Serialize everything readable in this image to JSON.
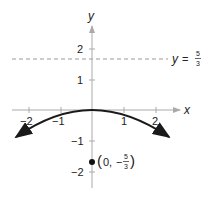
{
  "diagram": {
    "type": "parabola-graph",
    "equation": "x^2 = -(20/3) y",
    "axes": {
      "x_label": "x",
      "y_label": "y",
      "x_ticks": [
        {
          "value": -2,
          "label": "−2"
        },
        {
          "value": -1,
          "label": "−1"
        },
        {
          "value": 1,
          "label": "1"
        },
        {
          "value": 2,
          "label": "2"
        }
      ],
      "y_ticks": [
        {
          "value": 2,
          "label": "2"
        },
        {
          "value": 1,
          "label": "1"
        },
        {
          "value": -1,
          "label": "−1"
        },
        {
          "value": -2,
          "label": "−2"
        }
      ]
    },
    "directrix": {
      "label_prefix": "y =",
      "num": "5",
      "den": "3",
      "value": 1.6667
    },
    "focus": {
      "label_open": "(0, −",
      "num": "5",
      "den": "3",
      "label_close": ")",
      "x": 0,
      "y": -1.6667
    },
    "colors": {
      "axis": "#aaaaaa",
      "curve": "#1a1a1a",
      "dashed": "#9a9a9a",
      "text": "#222222"
    }
  }
}
